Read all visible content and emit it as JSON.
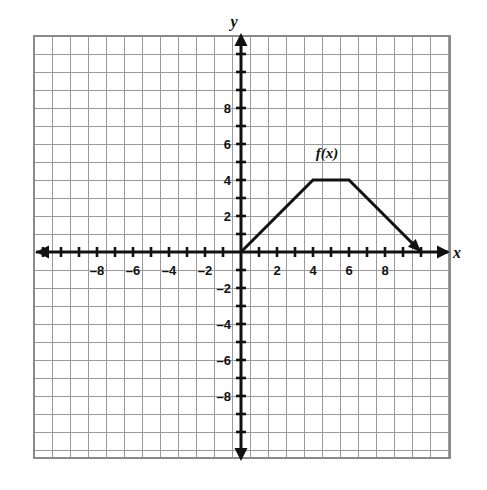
{
  "chart_data": {
    "type": "line",
    "title": "",
    "xlabel": "x",
    "ylabel": "y",
    "series_label": "f(x)",
    "x": [
      0,
      4,
      6,
      10
    ],
    "values": [
      0,
      4,
      4,
      0
    ],
    "points": [
      {
        "x": 0,
        "y": 0
      },
      {
        "x": 4,
        "y": 4
      },
      {
        "x": 6,
        "y": 4
      },
      {
        "x": 10,
        "y": 0
      }
    ],
    "xlim": [
      -11.5,
      11.6
    ],
    "ylim": [
      -11.5,
      11.7
    ],
    "grid": true,
    "grid_step": 1,
    "legend": "inline-label",
    "x_tick_labels": [
      "-8",
      "-6",
      "-4",
      "-2",
      "2",
      "4",
      "6",
      "8"
    ],
    "x_tick_values": [
      -8,
      -6,
      -4,
      -2,
      2,
      4,
      6,
      8
    ],
    "y_tick_labels": [
      "8",
      "6",
      "4",
      "2",
      "-2",
      "-4",
      "-6",
      "-8"
    ],
    "y_tick_values": [
      8,
      6,
      4,
      2,
      -2,
      -4,
      -6,
      -8
    ],
    "tick_interval": 1,
    "label_interval": 2,
    "colors": {
      "grid": "#9a9a9a",
      "axis": "#111111",
      "curve": "#111111",
      "background": "#ffffff"
    }
  },
  "figure": {
    "axis_x_name": "x",
    "axis_y_name": "y",
    "function_label": "f(x)"
  }
}
